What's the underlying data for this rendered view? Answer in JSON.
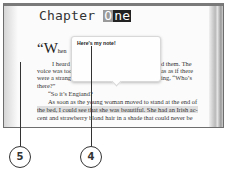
{
  "page": {
    "chapter_title_prefix": "Chapter ",
    "chapter_title_hl1": "O",
    "chapter_title_hl2": "ne",
    "dropcap": "“W",
    "dropcap_rest": "hen",
    "lines": [
      {
        "left": "I heard t",
        "right": "d them. The"
      },
      {
        "left": "voice was too",
        "right": "as as if there"
      },
      {
        "left": "were a strang",
        "right": "ing, “Who’s"
      },
      {
        "left": "there?”",
        "right": ""
      },
      {
        "left": "“So it’s Engiand?",
        "right": ""
      },
      {
        "full": "As soon as the young woman moved to stand at the end of"
      },
      {
        "full": "the bed, I could see that she was beautiful. She had an Irish ac-"
      },
      {
        "full": "cent and strawberry blond hair in a shade that could never be"
      }
    ]
  },
  "note": {
    "text": "Here's my note!"
  },
  "callouts": [
    {
      "label": "5",
      "target": "page-margin"
    },
    {
      "label": "4",
      "target": "note-popup"
    }
  ],
  "colors": {
    "highlight": "#222222",
    "selection": "#dedede",
    "frame": "#7a7a7a"
  }
}
